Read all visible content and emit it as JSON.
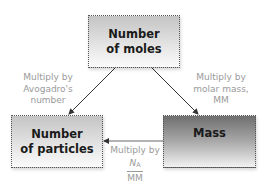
{
  "diagram": {
    "nodes": {
      "moles": {
        "line1": "Number",
        "line2": "of moles"
      },
      "particles": {
        "line1": "Number",
        "line2": "of particles"
      },
      "mass": {
        "label": "Mass"
      }
    },
    "edges": {
      "moles_to_particles": {
        "line1": "Multiply by",
        "line2": "Avogadro's",
        "line3": "number"
      },
      "moles_to_mass": {
        "line1": "Multiply by",
        "line2": "molar mass,",
        "line3": "MM"
      },
      "mass_to_particles": {
        "line1": "Multiply by",
        "numerator": "N",
        "numerator_sub": "A",
        "denominator": "MM"
      }
    },
    "colors": {
      "arrow": "#333333",
      "label_text": "#9a9a9a",
      "box_text": "#1a1a1a",
      "box_border": "#555555"
    }
  }
}
